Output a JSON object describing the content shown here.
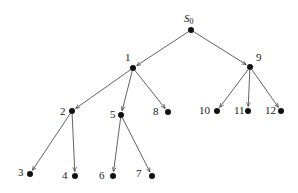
{
  "diagram": {
    "type": "tree",
    "directed": true,
    "colors": {
      "edge": "#3a3a3a",
      "node": "#111111",
      "label": "#222222",
      "background": "#ffffff"
    },
    "root": {
      "id": "S0",
      "label_main": "S",
      "label_sub": "0"
    },
    "nodes": [
      {
        "id": "S0",
        "label": "S0",
        "x": 191,
        "y": 30,
        "lx": 184,
        "ly": 22
      },
      {
        "id": "1",
        "label": "1",
        "x": 133,
        "y": 68,
        "lx": 125,
        "ly": 61
      },
      {
        "id": "9",
        "label": "9",
        "x": 250,
        "y": 67,
        "lx": 256,
        "ly": 61
      },
      {
        "id": "2",
        "label": "2",
        "x": 72,
        "y": 111,
        "lx": 60,
        "ly": 115
      },
      {
        "id": "5",
        "label": "5",
        "x": 121,
        "y": 115,
        "lx": 110,
        "ly": 118
      },
      {
        "id": "8",
        "label": "8",
        "x": 168,
        "y": 112,
        "lx": 153,
        "ly": 115
      },
      {
        "id": "10",
        "label": "10",
        "x": 217,
        "y": 111,
        "lx": 199,
        "ly": 114
      },
      {
        "id": "11",
        "label": "11",
        "x": 248,
        "y": 111,
        "lx": 234,
        "ly": 114
      },
      {
        "id": "12",
        "label": "12",
        "x": 281,
        "y": 111,
        "lx": 265,
        "ly": 114
      },
      {
        "id": "3",
        "label": "3",
        "x": 30,
        "y": 174,
        "lx": 18,
        "ly": 176
      },
      {
        "id": "4",
        "label": "4",
        "x": 75,
        "y": 176,
        "lx": 62,
        "ly": 179
      },
      {
        "id": "6",
        "label": "6",
        "x": 113,
        "y": 176,
        "lx": 99,
        "ly": 179
      },
      {
        "id": "7",
        "label": "7",
        "x": 152,
        "y": 176,
        "lx": 136,
        "ly": 177
      }
    ],
    "edges": [
      {
        "from": "S0",
        "to": "1"
      },
      {
        "from": "S0",
        "to": "9"
      },
      {
        "from": "1",
        "to": "2"
      },
      {
        "from": "1",
        "to": "5"
      },
      {
        "from": "1",
        "to": "8"
      },
      {
        "from": "9",
        "to": "10"
      },
      {
        "from": "9",
        "to": "11"
      },
      {
        "from": "9",
        "to": "12"
      },
      {
        "from": "2",
        "to": "3"
      },
      {
        "from": "2",
        "to": "4"
      },
      {
        "from": "5",
        "to": "6"
      },
      {
        "from": "5",
        "to": "7"
      }
    ]
  }
}
